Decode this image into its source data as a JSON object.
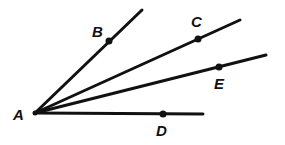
{
  "diagram": {
    "type": "rays from common vertex",
    "vertex": {
      "label": "A",
      "x": 35,
      "y": 113,
      "label_x": 13,
      "label_y": 120
    },
    "rays": [
      {
        "id": "AB",
        "end_x": 142,
        "end_y": 10,
        "point": {
          "label": "B",
          "x": 109,
          "y": 41,
          "label_x": 92,
          "label_y": 37
        }
      },
      {
        "id": "AC",
        "end_x": 240,
        "end_y": 20,
        "point": {
          "label": "C",
          "x": 198,
          "y": 39,
          "label_x": 191,
          "label_y": 27
        }
      },
      {
        "id": "AE",
        "end_x": 266,
        "end_y": 55,
        "point": {
          "label": "E",
          "x": 219,
          "y": 67,
          "label_x": 214,
          "label_y": 89
        }
      },
      {
        "id": "AD",
        "end_x": 203,
        "end_y": 114,
        "point": {
          "label": "D",
          "x": 163,
          "y": 114,
          "label_x": 156,
          "label_y": 136
        }
      }
    ],
    "colors": {
      "stroke": "#111111",
      "background": "#ffffff"
    }
  }
}
